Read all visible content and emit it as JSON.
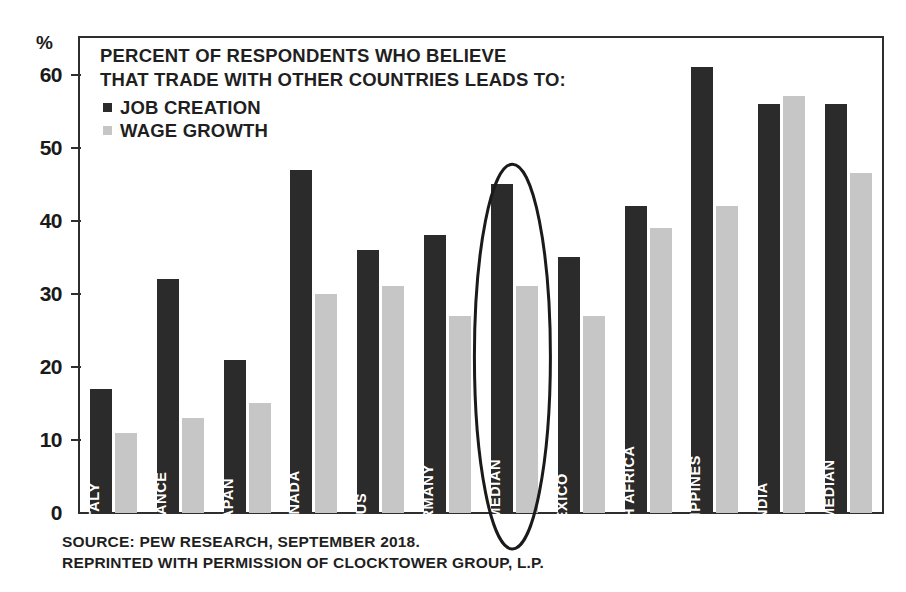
{
  "chart_data": {
    "type": "bar",
    "title": "PERCENT OF RESPONDENTS WHO BELIEVE THAT TRADE WITH OTHER COUNTRIES LEADS TO:",
    "title_lines": [
      "PERCENT OF RESPONDENTS WHO BELIEVE",
      "THAT TRADE WITH OTHER COUNTRIES LEADS TO:"
    ],
    "xlabel": "",
    "ylabel": "%",
    "ylim": [
      0,
      65
    ],
    "yticks": [
      0,
      10,
      20,
      30,
      40,
      50,
      60
    ],
    "ytick_labels": [
      "0",
      "10",
      "20",
      "30",
      "40",
      "50",
      "60"
    ],
    "grid": false,
    "legend_position": "upper-left",
    "categories": [
      "ITALY",
      "FRANCE",
      "JAPAN",
      "CANADA",
      "US",
      "GERMANY",
      "DM MEDIAN",
      "MEXICO",
      "SOUTH AFRICA",
      "PHILIPPINES",
      "INDIA",
      "EM MEDIAN"
    ],
    "series": [
      {
        "name": "JOB CREATION",
        "color": "#2b2b2b",
        "values": [
          17,
          32,
          21,
          47,
          36,
          38,
          45,
          35,
          42,
          61,
          56,
          56
        ]
      },
      {
        "name": "WAGE GROWTH",
        "color": "#c6c6c6",
        "values": [
          11,
          13,
          15,
          30,
          31,
          27,
          31,
          27,
          39,
          42,
          57,
          46.5
        ]
      }
    ],
    "annotations": [
      {
        "type": "ellipse",
        "target_category": "DM MEDIAN",
        "name": "dm-median-highlight",
        "color": "#1a1a1a"
      }
    ]
  },
  "legend": {
    "items": [
      {
        "label": "JOB CREATION",
        "color": "#2b2b2b"
      },
      {
        "label": "WAGE GROWTH",
        "color": "#c6c6c6"
      }
    ]
  },
  "axis": {
    "y_unit_label": "%"
  },
  "source": {
    "lines": [
      "SOURCE: PEW RESEARCH, SEPTEMBER 2018.",
      "REPRINTED WITH PERMISSION OF CLOCKTOWER GROUP, L.P."
    ],
    "line1": "SOURCE: PEW RESEARCH, SEPTEMBER 2018.",
    "line2": "REPRINTED WITH PERMISSION OF CLOCKTOWER GROUP, L.P."
  },
  "colors": {
    "dark_series": "#2b2b2b",
    "light_series": "#c6c6c6",
    "frame": "#2e2e2e",
    "text": "#1f1f1f",
    "background": "#ffffff"
  }
}
